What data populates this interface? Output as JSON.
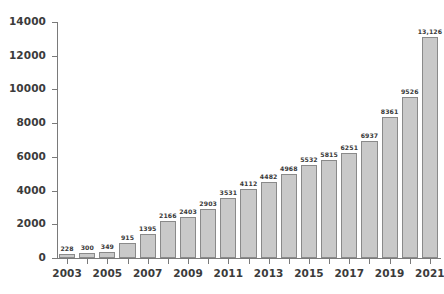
{
  "chart_data": {
    "type": "bar",
    "title": "",
    "xlabel": "",
    "ylabel": "",
    "ylim": [
      0,
      14000
    ],
    "grid": false,
    "legend": null,
    "yticks": [
      "0",
      "2000",
      "4000",
      "6000",
      "8000",
      "10000",
      "12000",
      "14000"
    ],
    "ytick_values": [
      0,
      2000,
      4000,
      6000,
      8000,
      10000,
      12000,
      14000
    ],
    "categories": [
      "2003",
      "2004",
      "2005",
      "2006",
      "2007",
      "2008",
      "2009",
      "2010",
      "2011",
      "2012",
      "2013",
      "2014",
      "2015",
      "2016",
      "2017",
      "2018",
      "2019",
      "2020",
      "2021"
    ],
    "xtick_labels_shown": [
      "2003",
      "2005",
      "2007",
      "2009",
      "2011",
      "2013",
      "2015",
      "2017",
      "2019",
      "2021"
    ],
    "values": [
      228,
      300,
      349,
      915,
      1395,
      2166,
      2403,
      2903,
      3531,
      4112,
      4482,
      4968,
      5532,
      5815,
      6251,
      6937,
      8361,
      9526,
      13126
    ],
    "value_labels": [
      "228",
      "300",
      "349",
      "915",
      "1395",
      "2166",
      "2403",
      "2903",
      "3531",
      "4112",
      "4482",
      "4968",
      "5532",
      "5815",
      "6251",
      "6937",
      "8361",
      "9526",
      "13,126"
    ],
    "colors": {
      "bar_fill": "#c9c9c9",
      "bar_border": "#8a8a8a",
      "axis": "#7a7a7a",
      "tick_text": "#3b3b3b",
      "value_text": "#3a3a3a",
      "background": "#ffffff"
    }
  }
}
